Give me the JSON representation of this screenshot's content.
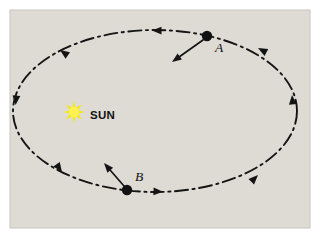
{
  "figure": {
    "panel_background_color": "#dedbd5",
    "page_background_color": "#ffffff",
    "panel_border_color": "#c9c5bd",
    "line_color": "#141414"
  },
  "sun": {
    "label": "SUN",
    "color": "#f5e800",
    "core_color": "#fcf24d",
    "center_x": 74,
    "center_y": 112,
    "label_x": 90,
    "label_y": 116,
    "points": 8,
    "outer_radius": 11,
    "inner_radius": 4.2
  },
  "orbit": {
    "shape": "ellipse",
    "center_x": 155,
    "center_y": 111,
    "radius_x": 142,
    "radius_y": 81,
    "style": "dash-dot",
    "stroke_color": "#141414",
    "stroke_width": 1.9,
    "direction": "clockwise-on-screen",
    "direction_arrows": [
      {
        "name": "top-arc-arrow",
        "x": 152,
        "y": 30.6,
        "angle_deg": 180
      },
      {
        "name": "upper-left-arrow",
        "x": 60,
        "y": 50,
        "angle_deg": 215
      },
      {
        "name": "left-arc-arrow",
        "x": 15.6,
        "y": 105,
        "angle_deg": 95
      },
      {
        "name": "lower-left-arrow",
        "x": 62,
        "y": 172,
        "angle_deg": 55
      },
      {
        "name": "bottom-arc-arrow",
        "x": 163,
        "y": 191.8,
        "angle_deg": 2
      },
      {
        "name": "lower-right-arrow",
        "x": 258,
        "y": 175,
        "angle_deg": 315
      },
      {
        "name": "right-arc-arrow",
        "x": 292,
        "y": 95,
        "angle_deg": 265
      },
      {
        "name": "upper-right-arrow",
        "x": 258,
        "y": 48,
        "angle_deg": 208
      }
    ]
  },
  "bodies": [
    {
      "id": "A",
      "label": "A",
      "dot_x": 207,
      "dot_y": 36,
      "dot_radius": 5.2,
      "label_x": 215,
      "label_y": 52,
      "force_arrow": {
        "name": "force-arrow-a",
        "from_x": 203,
        "from_y": 40,
        "to_x": 172,
        "to_y": 62,
        "description": "arrow from body A pointing down-left toward the Sun"
      }
    },
    {
      "id": "B",
      "label": "B",
      "dot_x": 127,
      "dot_y": 190,
      "dot_radius": 5.2,
      "label_x": 135,
      "label_y": 181,
      "force_arrow": {
        "name": "force-arrow-b",
        "from_x": 124,
        "from_y": 186,
        "to_x": 104,
        "to_y": 163,
        "description": "arrow from body B pointing up-left toward the Sun"
      }
    }
  ],
  "panel": {
    "x": 10,
    "y": 10,
    "width": 300,
    "height": 218
  }
}
